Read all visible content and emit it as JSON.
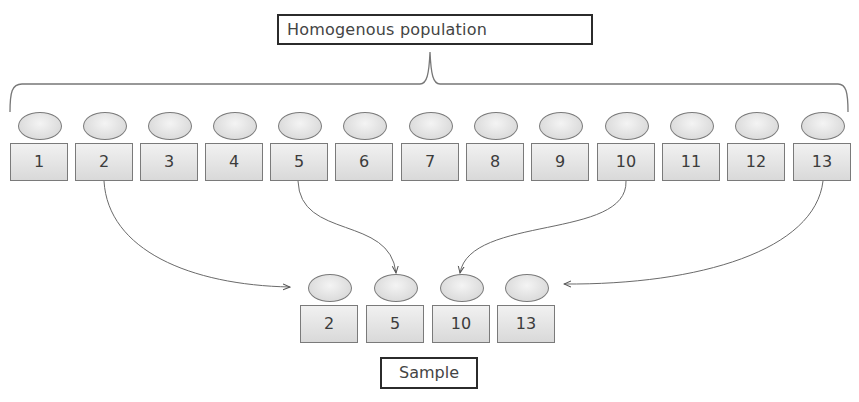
{
  "diagram": {
    "title": "Homogenous population",
    "population": [
      {
        "label": "1"
      },
      {
        "label": "2"
      },
      {
        "label": "3"
      },
      {
        "label": "4"
      },
      {
        "label": "5"
      },
      {
        "label": "6"
      },
      {
        "label": "7"
      },
      {
        "label": "8"
      },
      {
        "label": "9"
      },
      {
        "label": "10"
      },
      {
        "label": "11"
      },
      {
        "label": "12"
      },
      {
        "label": "13"
      }
    ],
    "sample": [
      {
        "label": "2"
      },
      {
        "label": "5"
      },
      {
        "label": "10"
      },
      {
        "label": "13"
      }
    ],
    "sample_label": "Sample",
    "arrows": [
      {
        "from": "2",
        "to": "2"
      },
      {
        "from": "5",
        "to": "5"
      },
      {
        "from": "10",
        "to": "10"
      },
      {
        "from": "13",
        "to": "13"
      }
    ],
    "colors": {
      "stroke": "#7a7a7a",
      "fill_light": "#f1f1f1",
      "fill_dark": "#d9d9d9",
      "border_dark": "#2b2b2b"
    }
  }
}
